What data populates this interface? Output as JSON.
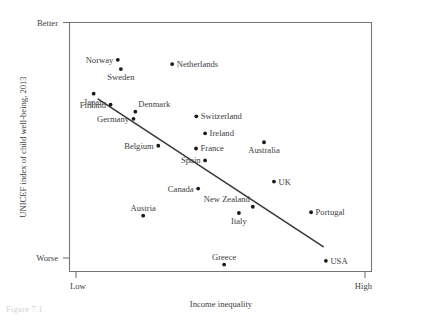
{
  "chart_data": {
    "type": "scatter",
    "title": "",
    "xlabel": "Income inequality",
    "ylabel": "UNICEF index of child well-being, 2013",
    "xtick_labels": [
      "Low",
      "High"
    ],
    "ytick_labels": [
      "Better",
      "Worse"
    ],
    "xlim": [
      0,
      100
    ],
    "ylim": [
      0,
      100
    ],
    "grid": false,
    "legend": null,
    "marker_color": "#1a1a1a",
    "trendline": {
      "label": "fitted regression line",
      "color": "#3a3a3a",
      "x": [
        9.5,
        84.0
      ],
      "y": [
        69.2,
        10.0
      ]
    },
    "points": [
      {
        "label": "Norway",
        "x": 16.0,
        "y": 85.0,
        "label_pos": "left"
      },
      {
        "label": "Sweden",
        "x": 17.0,
        "y": 81.3,
        "label_pos": "below"
      },
      {
        "label": "Netherlands",
        "x": 34.0,
        "y": 83.3,
        "label_pos": "right"
      },
      {
        "label": "Japan",
        "x": 8.0,
        "y": 71.4,
        "label_pos": "below"
      },
      {
        "label": "Finland",
        "x": 13.6,
        "y": 67.0,
        "label_pos": "left"
      },
      {
        "label": "Denmark",
        "x": 21.8,
        "y": 64.2,
        "label_pos": "above-right"
      },
      {
        "label": "Germany",
        "x": 21.2,
        "y": 61.3,
        "label_pos": "left"
      },
      {
        "label": "Switzerland",
        "x": 42.0,
        "y": 62.3,
        "label_pos": "right"
      },
      {
        "label": "Ireland",
        "x": 44.9,
        "y": 55.5,
        "label_pos": "right"
      },
      {
        "label": "Belgium",
        "x": 29.4,
        "y": 50.5,
        "label_pos": "left"
      },
      {
        "label": "France",
        "x": 41.9,
        "y": 49.4,
        "label_pos": "right"
      },
      {
        "label": "Australia",
        "x": 64.4,
        "y": 51.9,
        "label_pos": "below"
      },
      {
        "label": "Spain",
        "x": 44.9,
        "y": 44.6,
        "label_pos": "left"
      },
      {
        "label": "Canada",
        "x": 42.6,
        "y": 33.3,
        "label_pos": "left"
      },
      {
        "label": "UK",
        "x": 67.7,
        "y": 36.1,
        "label_pos": "right"
      },
      {
        "label": "New Zealand",
        "x": 60.7,
        "y": 26.0,
        "label_pos": "above-left"
      },
      {
        "label": "Italy",
        "x": 56.1,
        "y": 23.5,
        "label_pos": "below"
      },
      {
        "label": "Austria",
        "x": 24.4,
        "y": 22.4,
        "label_pos": "above"
      },
      {
        "label": "Portugal",
        "x": 80.0,
        "y": 23.8,
        "label_pos": "right"
      },
      {
        "label": "Greece",
        "x": 51.2,
        "y": 2.8,
        "label_pos": "above"
      },
      {
        "label": "USA",
        "x": 84.9,
        "y": 4.3,
        "label_pos": "right"
      }
    ]
  },
  "figure": {
    "caption": "Figure 7.1"
  }
}
